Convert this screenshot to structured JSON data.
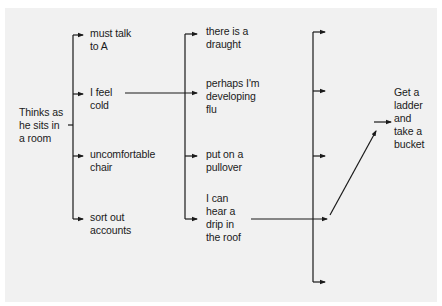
{
  "diagram": {
    "title": "",
    "colors": {
      "background": "#f1f1f1",
      "line": "#1a1a1a",
      "text": "#1a1a1a"
    },
    "root": {
      "label": "Thinks as\nhe sits in\na room"
    },
    "level1": [
      {
        "label": "must talk\nto A"
      },
      {
        "label": "I feel\ncold"
      },
      {
        "label": "uncomfortable\nchair"
      },
      {
        "label": "sort out\naccounts"
      }
    ],
    "level2": [
      {
        "label": "there is a\ndraught"
      },
      {
        "label": "perhaps I'm\ndeveloping\nflu"
      },
      {
        "label": "put on a\npullover"
      },
      {
        "label": "I can\nhear a\ndrip in\nthe roof"
      }
    ],
    "level3_branches": 5,
    "outcome": {
      "label": "Get a\nladder\nand\ntake a\nbucket"
    },
    "edges": [
      {
        "from": "root",
        "to": "level1 (bracket)"
      },
      {
        "from": "I feel cold",
        "to": "perhaps I'm developing flu"
      },
      {
        "from": "level2 (bracket)",
        "to": "level3 (bracket)"
      },
      {
        "from": "I can hear a drip in the roof",
        "to": "level3 branch 4"
      },
      {
        "from": "level3 branch 4",
        "to": "Get a ladder and take a bucket"
      }
    ]
  }
}
